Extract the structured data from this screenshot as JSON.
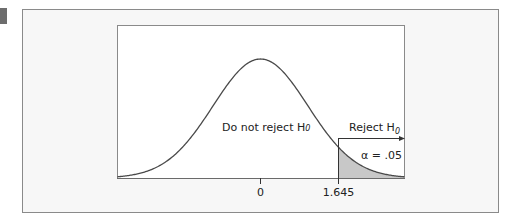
{
  "chart_data": {
    "type": "line",
    "title": "",
    "distribution": "standard normal",
    "xlabel": "",
    "ylabel": "",
    "x_ticks": [
      0,
      1.645
    ],
    "x_tick_labels": [
      "0",
      "1.645"
    ],
    "critical_value": 1.645,
    "shaded_region": {
      "from": 1.645,
      "to": 3,
      "area": 0.05
    },
    "annotations": {
      "do_not_reject": "Do not reject H",
      "do_not_reject_sub": "0",
      "reject": "Reject H",
      "reject_sub": "0",
      "alpha": "α = .05"
    },
    "xlim": [
      -3,
      3
    ],
    "grid": false,
    "colors": {
      "curve": "#4a4a4a",
      "shade": "#c8c8c8",
      "frame": "#8a8a8a",
      "panel": "#f7f7f7"
    }
  }
}
